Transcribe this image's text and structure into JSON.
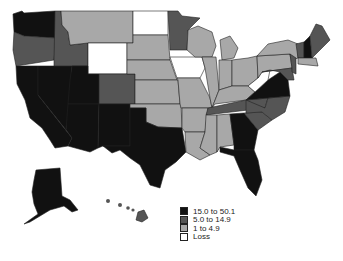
{
  "map": {
    "colors": {
      "high": "#111111",
      "mid": "#555555",
      "low": "#a8a8a8",
      "loss": "#ffffff"
    }
  },
  "legend": {
    "items": [
      {
        "label": "15.0 to 50.1",
        "class": "high",
        "color": "#111111"
      },
      {
        "label": "5.0 to 14.9",
        "class": "mid",
        "color": "#555555"
      },
      {
        "label": "1 to 4.9",
        "class": "low",
        "color": "#a8a8a8"
      },
      {
        "label": "Loss",
        "class": "loss",
        "color": "#ffffff"
      }
    ]
  },
  "states": {
    "WA": "high",
    "OR": "mid",
    "CA": "high",
    "NV": "high",
    "ID": "mid",
    "MT": "low",
    "WY": "loss",
    "UT": "high",
    "AZ": "high",
    "NM": "high",
    "CO": "mid",
    "ND": "loss",
    "SD": "low",
    "NE": "low",
    "KS": "low",
    "OK": "low",
    "TX": "high",
    "MN": "mid",
    "IA": "loss",
    "MO": "low",
    "AR": "low",
    "LA": "low",
    "WI": "low",
    "IL": "low",
    "MI": "low",
    "IN": "low",
    "OH": "low",
    "KY": "low",
    "TN": "mid",
    "MS": "low",
    "AL": "low",
    "GA": "high",
    "FL": "high",
    "SC": "mid",
    "NC": "mid",
    "VA": "high",
    "WV": "loss",
    "PA": "low",
    "NY": "low",
    "ME": "mid",
    "NH": "high",
    "VT": "mid",
    "MA": "low",
    "MD": "mid",
    "NJ": "mid",
    "AK": "high",
    "HI": "mid"
  }
}
